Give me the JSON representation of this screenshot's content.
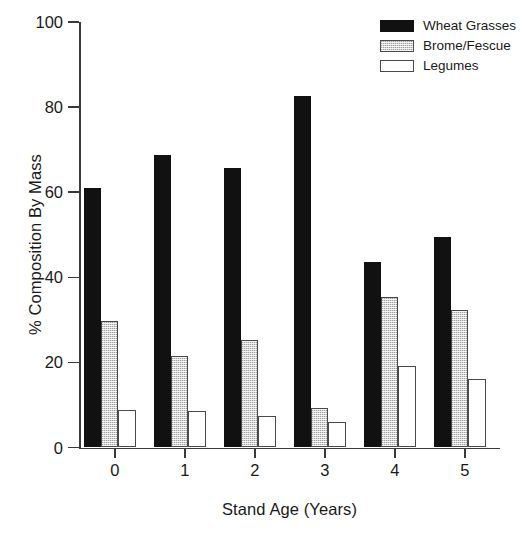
{
  "chart_data": {
    "type": "bar",
    "title": "",
    "xlabel": "Stand Age (Years)",
    "ylabel": "% Composition By Mass",
    "categories": [
      "0",
      "1",
      "2",
      "3",
      "4",
      "5"
    ],
    "series": [
      {
        "name": "Wheat Grasses",
        "color": "#111111",
        "values": [
          61.0,
          68.8,
          65.6,
          82.7,
          43.5,
          49.4
        ]
      },
      {
        "name": "Brome/Fescue",
        "color": "#d4d4d4",
        "values": [
          29.8,
          21.6,
          25.3,
          9.3,
          35.3,
          32.2
        ]
      },
      {
        "name": "Legumes",
        "color": "#ffffff",
        "values": [
          8.7,
          8.5,
          7.3,
          6.1,
          19.2,
          16.0
        ]
      }
    ],
    "ylim": [
      0,
      100
    ],
    "yticks": [
      "0",
      "20",
      "40",
      "60",
      "80",
      "100"
    ],
    "xticks": [
      "0",
      "1",
      "2",
      "3",
      "4",
      "5"
    ],
    "grid": false,
    "legend_position": "top-right"
  },
  "legend": {
    "entries": [
      {
        "label": "Wheat Grasses"
      },
      {
        "label": "Brome/Fescue"
      },
      {
        "label": "Legumes"
      }
    ]
  }
}
